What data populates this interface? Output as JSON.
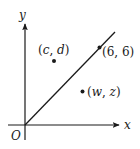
{
  "diagram": {
    "type": "coordinate-plane",
    "axes": {
      "x_label": "x",
      "y_label": "y",
      "origin_label": "O"
    },
    "line": {
      "description": "line y = x through origin",
      "passes_through": "(6, 6)"
    },
    "points": [
      {
        "id": "c-d",
        "label_open": "(",
        "var1": "c",
        "sep": ", ",
        "var2": "d",
        "label_close": ")",
        "position": "above line"
      },
      {
        "id": "six-six",
        "label": "(6, 6)",
        "position": "on line"
      },
      {
        "id": "w-z",
        "label_open": "(",
        "var1": "w",
        "sep": ", ",
        "var2": "z",
        "label_close": ")",
        "position": "below line"
      }
    ],
    "colors": {
      "ink": "#1a1a1a",
      "background": "#ffffff"
    }
  }
}
